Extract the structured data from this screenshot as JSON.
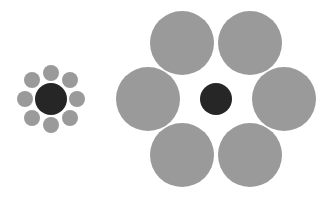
{
  "colors": {
    "background": "#ffffff",
    "center": "#262626",
    "surround": "#9a9a9a"
  },
  "left_group": {
    "center": {
      "cx": 51,
      "cy": 99,
      "r": 16
    },
    "surround": [
      {
        "cx": 51,
        "cy": 73,
        "r": 8
      },
      {
        "cx": 70,
        "cy": 80,
        "r": 8
      },
      {
        "cx": 77,
        "cy": 99,
        "r": 8
      },
      {
        "cx": 70,
        "cy": 118,
        "r": 8
      },
      {
        "cx": 51,
        "cy": 125,
        "r": 8
      },
      {
        "cx": 32,
        "cy": 118,
        "r": 8
      },
      {
        "cx": 25,
        "cy": 99,
        "r": 8
      },
      {
        "cx": 32,
        "cy": 80,
        "r": 8
      }
    ]
  },
  "right_group": {
    "center": {
      "cx": 216,
      "cy": 99,
      "r": 16
    },
    "surround": [
      {
        "cx": 182,
        "cy": 43,
        "r": 32
      },
      {
        "cx": 250,
        "cy": 43,
        "r": 32
      },
      {
        "cx": 284,
        "cy": 99,
        "r": 32
      },
      {
        "cx": 250,
        "cy": 155,
        "r": 32
      },
      {
        "cx": 182,
        "cy": 155,
        "r": 32
      },
      {
        "cx": 148,
        "cy": 99,
        "r": 32
      }
    ]
  }
}
